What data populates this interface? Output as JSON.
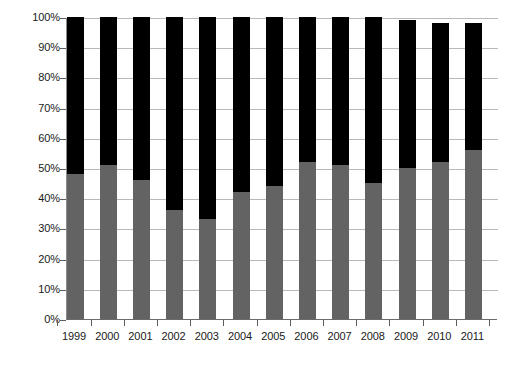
{
  "chart_data": {
    "type": "bar",
    "title": "",
    "subtitle": "",
    "xlabel": "",
    "ylabel": "",
    "stacked": true,
    "stack_mode": "percent",
    "grid": true,
    "legend": "none",
    "ylim": [
      0,
      100
    ],
    "ytick_labels": [
      "100%",
      "90%",
      "80%",
      "70%",
      "60%",
      "50%",
      "40%",
      "30%",
      "20%",
      "10%",
      "0%"
    ],
    "ytick_values": [
      100,
      90,
      80,
      70,
      60,
      50,
      40,
      30,
      20,
      10,
      0
    ],
    "categories": [
      "1999",
      "2000",
      "2001",
      "2002",
      "2003",
      "2004",
      "2005",
      "2006",
      "2007",
      "2008",
      "2009",
      "2010",
      "2011"
    ],
    "series": [
      {
        "name": "lower-gray-series",
        "color": "#636363",
        "values": [
          48,
          51,
          46,
          36,
          33,
          42,
          44,
          52,
          51,
          45,
          50,
          52,
          56
        ]
      },
      {
        "name": "upper-black-series",
        "color": "#000000",
        "values": [
          52,
          49,
          54,
          64,
          67,
          58,
          56,
          48,
          49,
          55,
          49,
          46,
          42
        ]
      }
    ],
    "totals": [
      100,
      100,
      100,
      100,
      100,
      100,
      100,
      100,
      100,
      100,
      99,
      98,
      98
    ]
  },
  "axes": {
    "y_axis_name": "percentage-axis",
    "x_axis_name": "year-axis"
  }
}
